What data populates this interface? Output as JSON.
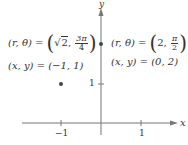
{
  "axes": {
    "x_label": "x",
    "y_label": "y",
    "x_ticks": [
      {
        "value": -1,
        "label": "−1"
      },
      {
        "value": 1,
        "label": "1"
      }
    ],
    "y_ticks": [
      {
        "value": 1,
        "label": "1"
      }
    ]
  },
  "points": [
    {
      "x": -1,
      "y": 1,
      "polar_lhs": "(r, θ) =",
      "polar_r": "2",
      "polar_theta_num": "3π",
      "polar_theta_den": "4",
      "cartesian": "(x, y) = (−1, 1)"
    },
    {
      "x": 0,
      "y": 2,
      "polar_lhs": "(r, θ) =",
      "polar_r": "2",
      "polar_theta_num": "π",
      "polar_theta_den": "2",
      "cartesian": "(x, y) = (0, 2)"
    }
  ],
  "colors": {
    "axis": "#777777",
    "point": "#444444",
    "text": "#333333"
  }
}
